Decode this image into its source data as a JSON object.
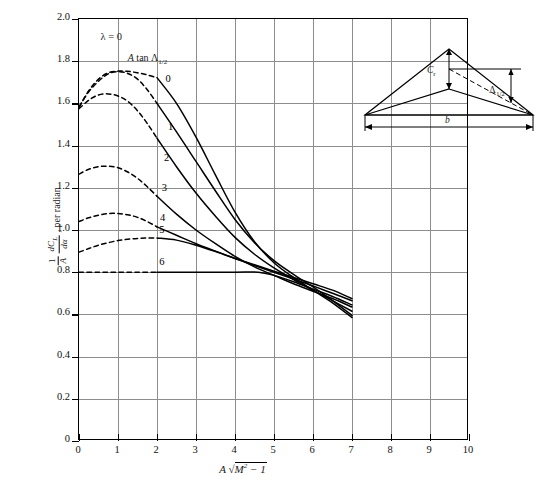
{
  "chart_data": {
    "type": "line",
    "title": "",
    "xlabel": "A√(M² − 1)",
    "ylabel": "(1/A)(dC_L/dα), per radian",
    "xlim": [
      0,
      10
    ],
    "ylim": [
      0,
      2.0
    ],
    "xticks": [
      "0",
      "1",
      "2",
      "3",
      "4",
      "5",
      "6",
      "7",
      "8",
      "9",
      "10"
    ],
    "yticks": [
      "0",
      "0.2",
      "0.4",
      "0.6",
      "0.8",
      "1.0",
      "1.2",
      "1.4",
      "1.6",
      "1.8",
      "2.0"
    ],
    "grid": true,
    "legend_position": "inline-curve-labels",
    "annotations": [
      {
        "text": "λ = 0",
        "x": 0.55,
        "y": 1.905
      },
      {
        "text": "A tan Λ₁⁄₂",
        "x": 1.25,
        "y": 1.805
      }
    ],
    "series_parameter_name": "A tan Λ_1/2",
    "series": [
      {
        "name": "0",
        "label": "0",
        "dashed_points": [
          [
            0,
            1.58
          ],
          [
            0.25,
            1.66
          ],
          [
            0.5,
            1.715
          ],
          [
            0.75,
            1.745
          ],
          [
            1.0,
            1.753
          ],
          [
            1.25,
            1.752
          ],
          [
            1.5,
            1.745
          ],
          [
            1.75,
            1.735
          ],
          [
            2.0,
            1.722
          ]
        ],
        "solid_points": [
          [
            2.0,
            1.722
          ],
          [
            2.5,
            1.6
          ],
          [
            3.0,
            1.44
          ],
          [
            3.5,
            1.26
          ],
          [
            4.0,
            1.085
          ],
          [
            4.5,
            0.945
          ],
          [
            5.0,
            0.845
          ],
          [
            5.5,
            0.775
          ],
          [
            6.0,
            0.715
          ],
          [
            6.5,
            0.655
          ],
          [
            7.0,
            0.585
          ]
        ]
      },
      {
        "name": "1",
        "label": "1",
        "dashed_points": [
          [
            0,
            1.585
          ],
          [
            0.25,
            1.655
          ],
          [
            0.5,
            1.705
          ],
          [
            0.75,
            1.74
          ],
          [
            1.0,
            1.75
          ],
          [
            1.25,
            1.742
          ],
          [
            1.5,
            1.715
          ],
          [
            1.75,
            1.665
          ],
          [
            2.0,
            1.6
          ]
        ],
        "solid_points": [
          [
            2.0,
            1.6
          ],
          [
            2.5,
            1.465
          ],
          [
            3.0,
            1.325
          ],
          [
            3.5,
            1.185
          ],
          [
            4.0,
            1.05
          ],
          [
            4.5,
            0.94
          ],
          [
            5.0,
            0.855
          ],
          [
            5.5,
            0.79
          ],
          [
            6.0,
            0.73
          ],
          [
            6.5,
            0.665
          ],
          [
            7.0,
            0.595
          ]
        ]
      },
      {
        "name": "2",
        "label": "2",
        "dashed_points": [
          [
            0,
            1.575
          ],
          [
            0.25,
            1.615
          ],
          [
            0.5,
            1.64
          ],
          [
            0.75,
            1.645
          ],
          [
            1.0,
            1.635
          ],
          [
            1.25,
            1.61
          ],
          [
            1.5,
            1.565
          ],
          [
            1.75,
            1.505
          ],
          [
            2.0,
            1.435
          ]
        ],
        "solid_points": [
          [
            2.0,
            1.435
          ],
          [
            2.5,
            1.3
          ],
          [
            3.0,
            1.175
          ],
          [
            3.5,
            1.065
          ],
          [
            4.0,
            0.965
          ],
          [
            4.5,
            0.885
          ],
          [
            5.0,
            0.82
          ],
          [
            5.5,
            0.765
          ],
          [
            6.0,
            0.715
          ],
          [
            6.5,
            0.665
          ],
          [
            7.0,
            0.615
          ]
        ]
      },
      {
        "name": "3",
        "label": "3",
        "dashed_points": [
          [
            0,
            1.265
          ],
          [
            0.25,
            1.288
          ],
          [
            0.5,
            1.3
          ],
          [
            0.75,
            1.302
          ],
          [
            1.0,
            1.295
          ],
          [
            1.25,
            1.275
          ],
          [
            1.5,
            1.245
          ],
          [
            1.75,
            1.205
          ],
          [
            2.0,
            1.16
          ]
        ],
        "solid_points": [
          [
            2.0,
            1.16
          ],
          [
            2.5,
            1.075
          ],
          [
            3.0,
            1.0
          ],
          [
            3.5,
            0.935
          ],
          [
            4.0,
            0.875
          ],
          [
            4.5,
            0.825
          ],
          [
            5.0,
            0.785
          ],
          [
            5.5,
            0.745
          ],
          [
            6.0,
            0.71
          ],
          [
            6.5,
            0.675
          ],
          [
            7.0,
            0.635
          ]
        ]
      },
      {
        "name": "4",
        "label": "4",
        "dashed_points": [
          [
            0,
            1.04
          ],
          [
            0.25,
            1.058
          ],
          [
            0.5,
            1.07
          ],
          [
            0.75,
            1.078
          ],
          [
            1.0,
            1.078
          ],
          [
            1.25,
            1.072
          ],
          [
            1.5,
            1.06
          ],
          [
            1.75,
            1.04
          ],
          [
            2.0,
            1.015
          ]
        ],
        "solid_points": [
          [
            2.0,
            1.015
          ],
          [
            2.5,
            0.975
          ],
          [
            3.0,
            0.935
          ],
          [
            3.5,
            0.9
          ],
          [
            4.0,
            0.865
          ],
          [
            4.5,
            0.835
          ],
          [
            5.0,
            0.805
          ],
          [
            5.5,
            0.775
          ],
          [
            6.0,
            0.745
          ],
          [
            6.5,
            0.715
          ],
          [
            7.0,
            0.675
          ]
        ]
      },
      {
        "name": "5",
        "label": "5",
        "dashed_points": [
          [
            0,
            0.895
          ],
          [
            0.25,
            0.912
          ],
          [
            0.5,
            0.928
          ],
          [
            0.75,
            0.94
          ],
          [
            1.0,
            0.95
          ],
          [
            1.25,
            0.956
          ],
          [
            1.5,
            0.96
          ],
          [
            1.75,
            0.962
          ],
          [
            2.0,
            0.962
          ]
        ],
        "solid_points": [
          [
            2.0,
            0.962
          ],
          [
            2.5,
            0.952
          ],
          [
            3.0,
            0.928
          ],
          [
            3.5,
            0.898
          ],
          [
            4.0,
            0.865
          ],
          [
            4.5,
            0.832
          ],
          [
            5.0,
            0.8
          ],
          [
            5.5,
            0.768
          ],
          [
            6.0,
            0.735
          ],
          [
            6.5,
            0.7
          ],
          [
            7.0,
            0.665
          ]
        ]
      },
      {
        "name": "6",
        "label": "6",
        "dashed_points": [
          [
            0,
            0.8
          ],
          [
            0.5,
            0.8
          ],
          [
            1.0,
            0.8
          ],
          [
            1.5,
            0.8
          ],
          [
            2.0,
            0.8
          ]
        ],
        "solid_points": [
          [
            2.0,
            0.8
          ],
          [
            3.0,
            0.8
          ],
          [
            4.0,
            0.8
          ],
          [
            4.6,
            0.8
          ],
          [
            5.0,
            0.785
          ],
          [
            5.5,
            0.755
          ],
          [
            6.0,
            0.72
          ],
          [
            6.5,
            0.685
          ],
          [
            7.0,
            0.645
          ]
        ]
      }
    ],
    "curve_labels": [
      {
        "text": "0",
        "x": 2.22,
        "y": 1.71
      },
      {
        "text": "1",
        "x": 2.28,
        "y": 1.485
      },
      {
        "text": "2",
        "x": 2.18,
        "y": 1.335
      },
      {
        "text": "3",
        "x": 2.12,
        "y": 1.195
      },
      {
        "text": "4",
        "x": 2.08,
        "y": 1.05
      },
      {
        "text": "5",
        "x": 2.06,
        "y": 0.995
      },
      {
        "text": "6",
        "x": 2.06,
        "y": 0.845
      }
    ]
  },
  "inset": {
    "name": "delta-wing-planform",
    "root_chord_label": "C",
    "root_chord_sub": "r",
    "sweep_label": "Λ",
    "sweep_sub": "1/2",
    "span_label": "b"
  }
}
